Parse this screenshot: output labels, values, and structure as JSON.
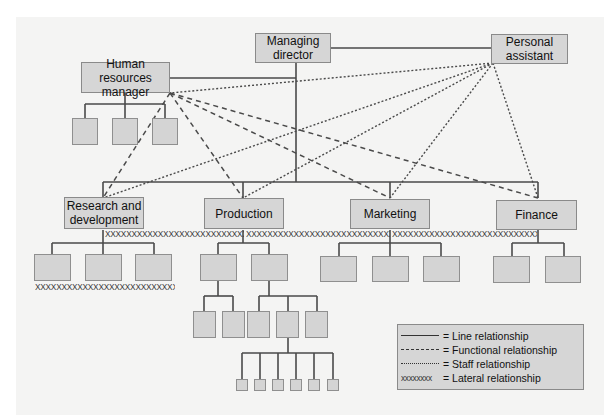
{
  "diagram": {
    "title": "",
    "nodes": {
      "managing_director": "Managing\ndirector",
      "personal_assistant": "Personal\nassistant",
      "hr_manager": "Human resources\nmanager",
      "research_development": "Research and\ndevelopment",
      "production": "Production",
      "marketing": "Marketing",
      "finance": "Finance"
    },
    "node_lines": {
      "managing_director": [
        "Managing",
        "director"
      ],
      "personal_assistant": [
        "Personal",
        "assistant"
      ],
      "hr_manager": [
        "Human resources",
        "manager"
      ],
      "research_development": [
        "Research and",
        "development"
      ],
      "production": [
        "Production"
      ],
      "marketing": [
        "Marketing"
      ],
      "finance": [
        "Finance"
      ]
    },
    "lateral_marks": {
      "top_row_left": "XXXXXXXXXXXXXXXXXXXXXXXXXXXX",
      "top_row_mid": "XXXXXXXXXXXXXXXXXXXXXXXXXXXXXXXXXXXXXX",
      "top_row_right": "XXXXXXXXXXXXXXXXXXXXXXXXXXXXXX",
      "rd_subordinates": "XXXXXXXXXXXXXXXXXXXXXXXXXXXXXXXXX"
    },
    "legend": {
      "items": [
        {
          "sample": "solid",
          "label": "= Line relationship"
        },
        {
          "sample": "dashed",
          "label": "= Functional relationship"
        },
        {
          "sample": "dotted",
          "label": "= Staff relationship"
        },
        {
          "sample": "xxxxxxxx",
          "label": "= Lateral relationship"
        }
      ]
    },
    "colors": {
      "panel_bg": "#f4f4f3",
      "box_fill": "#d6d6d6",
      "box_border": "#8a8a8a",
      "line": "#4a4a4a"
    }
  }
}
